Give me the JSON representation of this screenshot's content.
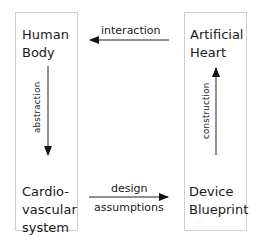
{
  "nodes": {
    "human_body": {
      "line1": "Human",
      "line2": "Body"
    },
    "cardiovascular": {
      "line1": "Cardio-",
      "line2": "vascular",
      "line3": "system"
    },
    "artificial_heart": {
      "line1": "Artificial",
      "line2": "Heart"
    },
    "device_blueprint": {
      "line1": "Device",
      "line2": "Blueprint"
    }
  },
  "edges": {
    "interaction": "interaction",
    "abstraction": "abstraction",
    "construction": "construction",
    "design": "design",
    "assumptions": "assumptions"
  }
}
